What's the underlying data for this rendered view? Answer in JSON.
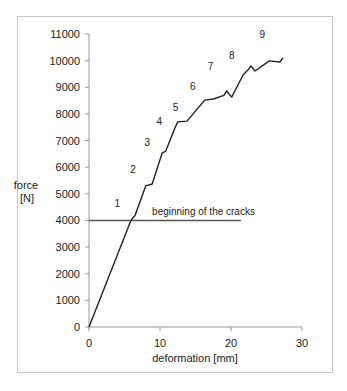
{
  "chart_data": {
    "type": "line",
    "title": "",
    "xlabel": "deformation [mm]",
    "ylabel": "force [N]",
    "ylabel_lines": [
      "force",
      "[N]"
    ],
    "xlim": [
      0,
      30
    ],
    "ylim": [
      0,
      11000
    ],
    "xticks": [
      0,
      10,
      20,
      30
    ],
    "yticks": [
      0,
      1000,
      2000,
      3000,
      4000,
      5000,
      6000,
      7000,
      8000,
      9000,
      10000,
      11000
    ],
    "grid": false,
    "legend": null,
    "series": [
      {
        "name": "force-deformation",
        "color": "#222222",
        "x": [
          0,
          5.9,
          6.5,
          8.0,
          8.9,
          10.3,
          10.8,
          12.1,
          12.5,
          13.8,
          16.3,
          17.5,
          19.0,
          19.4,
          20.1,
          21.7,
          22.5,
          22.8,
          23.4,
          25.4,
          26.9,
          27.3
        ],
        "y": [
          0,
          4000,
          4200,
          5300,
          5370,
          6530,
          6600,
          7470,
          7700,
          7730,
          8520,
          8560,
          8700,
          8860,
          8630,
          9460,
          9690,
          9800,
          9610,
          9990,
          9950,
          10100
        ]
      }
    ],
    "reference_lines": [
      {
        "label": "beginning of the cracks",
        "y": 4000,
        "x_start": 0,
        "x_end": 21.4
      }
    ],
    "annotations": [
      {
        "text": "1",
        "x": 4.0,
        "y": 4500
      },
      {
        "text": "2",
        "x": 6.2,
        "y": 5780
      },
      {
        "text": "3",
        "x": 8.2,
        "y": 6800
      },
      {
        "text": "4",
        "x": 9.9,
        "y": 7580
      },
      {
        "text": "5",
        "x": 12.2,
        "y": 8110
      },
      {
        "text": "6",
        "x": 14.6,
        "y": 8900
      },
      {
        "text": "7",
        "x": 17.1,
        "y": 9650
      },
      {
        "text": "8",
        "x": 20.1,
        "y": 10060
      },
      {
        "text": "9",
        "x": 24.4,
        "y": 10850
      }
    ]
  }
}
